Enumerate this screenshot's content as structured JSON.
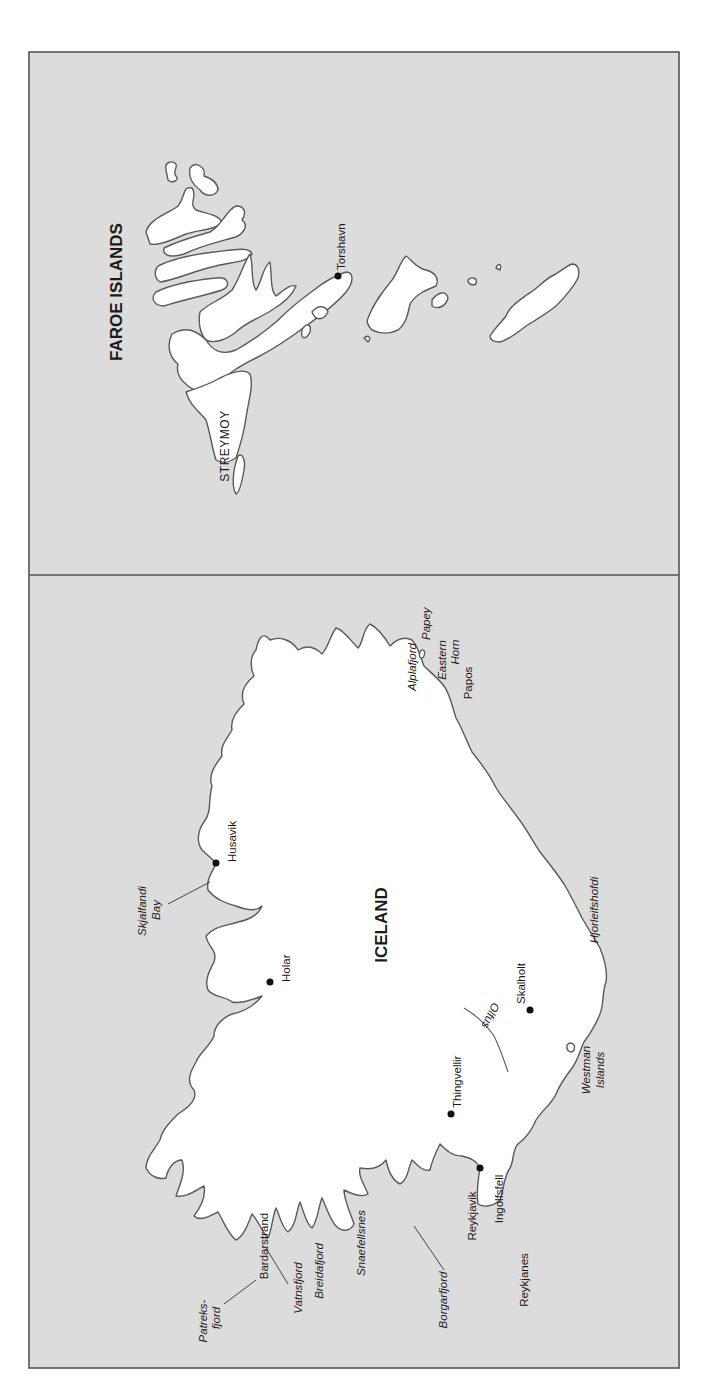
{
  "map": {
    "panels": [
      {
        "id": "faroe",
        "title": "FAROE ISLANDS",
        "islands": [
          {
            "name": "STREYMOY"
          }
        ],
        "towns": [
          {
            "name": "Torshavn",
            "dot": [
              338,
              276
            ]
          }
        ]
      },
      {
        "id": "iceland",
        "title": "ICELAND",
        "towns": [
          {
            "name": "Husavik",
            "dot": [
              216,
              863
            ]
          },
          {
            "name": "Holar",
            "dot": [
              270,
              982
            ]
          },
          {
            "name": "Skalholt",
            "dot": [
              530,
              1010
            ]
          },
          {
            "name": "Thingvellir",
            "dot": [
              451,
              1114
            ]
          },
          {
            "name": "Reykjavik",
            "dot": [
              480,
              1168
            ]
          }
        ],
        "places": [
          "Papos",
          "Ingolfsfell",
          "Reykjanes",
          "Bardarstrand"
        ],
        "features": [
          "Alplafjord",
          "Papey",
          "Eastern",
          "Horn",
          "Skjalfandi",
          "Bay",
          "Hjorleifshofdi",
          "Olfus",
          "Westman",
          "Islands",
          "Borgarfjord",
          "Snaefellsnes",
          "Breidafjord",
          "Vatnsfjord",
          "Patreks-",
          "fjord"
        ]
      }
    ],
    "labels": {
      "faroe_title": "FAROE ISLANDS",
      "streymoy": "STREYMOY",
      "torshavn": "Torshavn",
      "iceland_title": "ICELAND",
      "alplafjord": "Alplafjord",
      "papey": "Papey",
      "eastern": "Eastern",
      "horn": "Horn",
      "papos": "Papos",
      "husavik": "Husavik",
      "skjalfandi": "Skjalfandi",
      "bay": "Bay",
      "holar": "Holar",
      "hjorleifshofdi": "Hjorleifshofdi",
      "skalholt": "Skalholt",
      "olfus": "Olfus",
      "westman": "Westman",
      "islands": "Islands",
      "thingvellir": "Thingvellir",
      "ingolfsfell": "Ingolfsfell",
      "reykjavik": "Reykjavik",
      "reykjanes": "Reykjanes",
      "borgarfjord": "Borgarfjord",
      "snaefellsnes": "Snaefellsnes",
      "breidafjord": "Breidafjord",
      "vatnsfjord": "Vatnsfjord",
      "bardarstrand": "Bardarstrand",
      "patreks": "Patreks-",
      "fjord": "fjord"
    },
    "colors": {
      "sea": "#dcdcdc",
      "land": "#ffffff",
      "coastline": "#5a5a5a",
      "frame": "#555555",
      "text": "#1a1a1a"
    }
  }
}
